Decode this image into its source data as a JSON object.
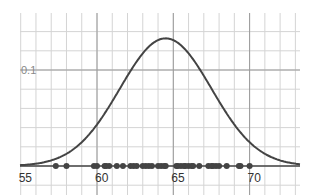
{
  "chart_data": {
    "type": "line",
    "title": "",
    "xlabel": "",
    "ylabel": "",
    "xlim": [
      53.8,
      74.2
    ],
    "ylim": [
      0,
      0.16
    ],
    "grid": true,
    "x_ticks": [
      55,
      60,
      65,
      70
    ],
    "x_tick_labels": [
      "55",
      "60",
      "65",
      "70"
    ],
    "y_ticks": [
      0.1
    ],
    "y_tick_labels": [
      "0.1"
    ],
    "curve": {
      "kind": "normal-pdf",
      "mean": 64.5,
      "sd": 3.0,
      "peak_y": 0.133,
      "color": "#444444"
    },
    "points": {
      "y": 0,
      "color": "#444444",
      "x": [
        57.3,
        58.0,
        59.8,
        60.0,
        60.5,
        60.6,
        60.8,
        61.3,
        61.7,
        62.2,
        62.4,
        62.6,
        63.0,
        63.2,
        63.4,
        63.6,
        64.0,
        64.2,
        64.4,
        64.5,
        65.2,
        65.3,
        65.5,
        65.7,
        65.8,
        66.0,
        66.2,
        66.3,
        66.7,
        67.3,
        67.5,
        67.6,
        67.8,
        68.0,
        68.5,
        69.3,
        69.4,
        70.0
      ]
    }
  }
}
